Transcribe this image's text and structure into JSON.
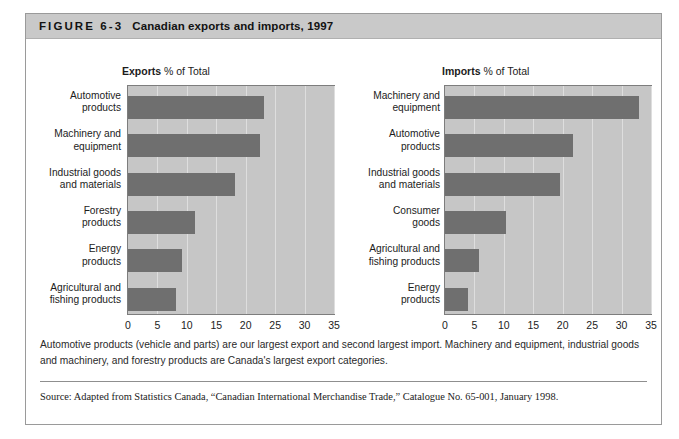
{
  "figure": {
    "label": "FIGURE 6-3",
    "title": "Canadian exports and imports, 1997",
    "caption": "Automotive products (vehicle and parts) are our largest export and second largest import. Machinery and equipment, industrial goods and machinery, and forestry products are Canada's largest export categories.",
    "source": "Source: Adapted from Statistics Canada, “Canadian International Merchandise Trade,” Catalogue No. 65-001, January 1998.",
    "colors": {
      "header_band": "#c9c9c9",
      "plot_background": "#c6c6c6",
      "bar_fill": "#6f6f6f",
      "gridline": "#dedede",
      "frame_border": "#9a9a9a"
    }
  },
  "chart_data": [
    {
      "id": "exports",
      "type": "bar",
      "orientation": "horizontal",
      "title": "Exports % of Total",
      "title_bold_part": "Exports",
      "title_rest": " % of Total",
      "xlabel": "",
      "ylabel": "",
      "xlim": [
        0,
        35
      ],
      "ticks": [
        0,
        5,
        10,
        15,
        20,
        25,
        30,
        35
      ],
      "grid": true,
      "legend": "none",
      "categories": [
        "Automotive\nproducts",
        "Machinery and\nequipment",
        "Industrial goods\nand materials",
        "Forestry\nproducts",
        "Energy\nproducts",
        "Agricultural and\nfishing products"
      ],
      "values": [
        23.1,
        22.4,
        18.1,
        11.4,
        9.1,
        8.1
      ]
    },
    {
      "id": "imports",
      "type": "bar",
      "orientation": "horizontal",
      "title": "Imports % of Total",
      "title_bold_part": "Imports",
      "title_rest": " % of Total",
      "xlabel": "",
      "ylabel": "",
      "xlim": [
        0,
        35
      ],
      "ticks": [
        0,
        5,
        10,
        15,
        20,
        25,
        30,
        35
      ],
      "grid": true,
      "legend": "none",
      "categories": [
        "Machinery and\nequipment",
        "Automotive\nproducts",
        "Industrial goods\nand materials",
        "Consumer\ngoods",
        "Agricultural and\nfishing products",
        "Energy\nproducts"
      ],
      "values": [
        33.0,
        21.7,
        19.5,
        10.4,
        5.7,
        3.9
      ]
    }
  ]
}
